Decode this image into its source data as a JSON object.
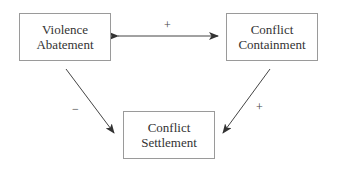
{
  "nodes": [
    {
      "id": "violence-abatement",
      "lines": [
        "Violence",
        "Abatement"
      ]
    },
    {
      "id": "conflict-containment",
      "lines": [
        "Conflict",
        "Containment"
      ]
    },
    {
      "id": "conflict-settlement",
      "lines": [
        "Conflict",
        "Settlement"
      ]
    }
  ],
  "edges": [
    {
      "from": "violence-abatement",
      "to": "conflict-containment",
      "sign": "+",
      "bidirectional": true
    },
    {
      "from": "violence-abatement",
      "to": "conflict-settlement",
      "sign": "−"
    },
    {
      "from": "conflict-containment",
      "to": "conflict-settlement",
      "sign": "+"
    }
  ],
  "colors": {
    "line": "#444444",
    "border": "#9a9a9a",
    "text": "#333333"
  }
}
